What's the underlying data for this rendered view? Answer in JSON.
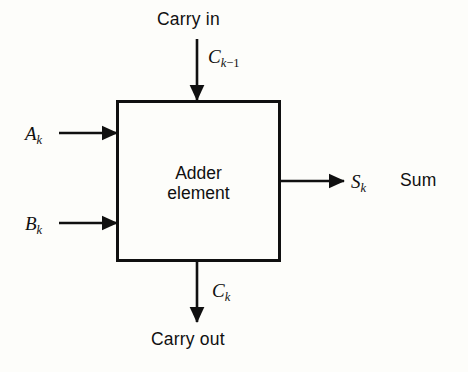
{
  "figure": {
    "title_text": "",
    "background_color": "#fdfdfa",
    "line_color": "#101010",
    "block": {
      "label_line1": "Adder",
      "label_line2": "element"
    },
    "inputs": [
      {
        "name": "carry-in",
        "caption": "Carry in",
        "symbol_base": "C",
        "symbol_sub": "k−1",
        "direction": "down",
        "side": "top"
      },
      {
        "name": "operand-a",
        "caption": "",
        "symbol_base": "A",
        "symbol_sub": "k",
        "direction": "right",
        "side": "left"
      },
      {
        "name": "operand-b",
        "caption": "",
        "symbol_base": "B",
        "symbol_sub": "k",
        "direction": "right",
        "side": "left"
      }
    ],
    "outputs": [
      {
        "name": "sum",
        "caption": "Sum",
        "symbol_base": "S",
        "symbol_sub": "k",
        "direction": "right",
        "side": "right"
      },
      {
        "name": "carry-out",
        "caption": "Carry out",
        "symbol_base": "C",
        "symbol_sub": "k",
        "direction": "down",
        "side": "bottom"
      }
    ]
  },
  "labels": {
    "carry_in_caption": "Carry in",
    "carry_in_sym_base": "C",
    "carry_in_sym_sub_var": "k",
    "carry_in_sym_sub_op": "−",
    "carry_in_sym_sub_num": "1",
    "a_sym_base": "A",
    "a_sym_sub": "k",
    "b_sym_base": "B",
    "b_sym_sub": "k",
    "s_sym_base": "S",
    "s_sym_sub": "k",
    "sum_caption": "Sum",
    "carry_out_sym_base": "C",
    "carry_out_sym_sub": "k",
    "carry_out_caption": "Carry out",
    "block_line1": "Adder",
    "block_line2": "element"
  }
}
